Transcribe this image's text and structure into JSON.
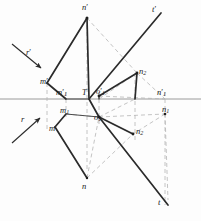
{
  "figure": {
    "ground_line": {
      "name": "horizontal-axis",
      "y": 99,
      "x1": 0,
      "x2": 201,
      "color": "#9a9a9a"
    },
    "colors": {
      "solid_line": "#2b2b2b",
      "dashed_line": "#b5b5b5",
      "axis": "#9a9a9a",
      "label_text": "#1a1a1a",
      "background": "#fdfdfd"
    }
  },
  "labels": {
    "n_prime": {
      "text": "n",
      "prime": "′",
      "sub": ""
    },
    "t_prime": {
      "text": "t",
      "prime": "′",
      "sub": ""
    },
    "r_prime": {
      "text": "r",
      "prime": "′",
      "sub": ""
    },
    "m_prime": {
      "text": "m",
      "prime": "′",
      "sub": ""
    },
    "m1_prime": {
      "text": "m",
      "prime": "′",
      "sub": "1"
    },
    "T": {
      "text": "T",
      "prime": "",
      "sub": ""
    },
    "o1_prime": {
      "text": "o",
      "prime": "′",
      "sub": "1"
    },
    "n2_upper": {
      "text": "n",
      "prime": "",
      "sub": "2"
    },
    "n1_prime": {
      "text": "n",
      "prime": "′",
      "sub": "1"
    },
    "r": {
      "text": "r",
      "prime": "",
      "sub": ""
    },
    "m1": {
      "text": "m",
      "prime": "",
      "sub": "1"
    },
    "m": {
      "text": "m",
      "prime": "",
      "sub": ""
    },
    "o1": {
      "text": "o",
      "prime": "",
      "sub": "1"
    },
    "n1": {
      "text": "n",
      "prime": "",
      "sub": "1"
    },
    "n2_lower": {
      "text": "n",
      "prime": "",
      "sub": "2"
    },
    "n": {
      "text": "n",
      "prime": "",
      "sub": ""
    },
    "t": {
      "text": "t",
      "prime": "",
      "sub": ""
    }
  },
  "label_positions": {
    "n_prime": {
      "x": 82,
      "y": 3
    },
    "t_prime": {
      "x": 152,
      "y": 5
    },
    "r_prime": {
      "x": 26,
      "y": 48
    },
    "m_prime": {
      "x": 40,
      "y": 77
    },
    "m1_prime": {
      "x": 56,
      "y": 88
    },
    "T": {
      "x": 82,
      "y": 88
    },
    "o1_prime": {
      "x": 96,
      "y": 87
    },
    "n2_upper": {
      "x": 139,
      "y": 67
    },
    "n1_prime": {
      "x": 157,
      "y": 88
    },
    "r": {
      "x": 21,
      "y": 115
    },
    "m1": {
      "x": 60,
      "y": 106
    },
    "m": {
      "x": 49,
      "y": 124
    },
    "o1": {
      "x": 94,
      "y": 113
    },
    "n1": {
      "x": 162,
      "y": 105
    },
    "n2_lower": {
      "x": 136,
      "y": 127
    },
    "n": {
      "x": 82,
      "y": 182
    },
    "t": {
      "x": 158,
      "y": 198
    }
  },
  "vertices": {
    "n_prime": {
      "x": 87,
      "y": 18
    },
    "m_prime": {
      "x": 47,
      "y": 83
    },
    "m1_prime": {
      "x": 66,
      "y": 99
    },
    "T": {
      "x": 89,
      "y": 99
    },
    "o1_prime": {
      "x": 99,
      "y": 96
    },
    "n2_upper": {
      "x": 137,
      "y": 73
    },
    "n1_prime": {
      "x": 165,
      "y": 99
    },
    "m1": {
      "x": 66,
      "y": 114
    },
    "m": {
      "x": 55,
      "y": 127
    },
    "o1": {
      "x": 99,
      "y": 117
    },
    "n1": {
      "x": 165,
      "y": 114
    },
    "n2_lower": {
      "x": 133,
      "y": 134
    },
    "n": {
      "x": 87,
      "y": 178
    },
    "t_prime_end": {
      "x": 161,
      "y": 13
    },
    "t_end": {
      "x": 168,
      "y": 205
    },
    "left_v_top": {
      "x": 47,
      "y": 83
    },
    "left_v_bot": {
      "x": 55,
      "y": 127
    }
  },
  "arrows": {
    "r_prime": {
      "from_x": 12,
      "from_y": 44,
      "to_x": 43,
      "to_y": 70,
      "direction": "down-right"
    },
    "r": {
      "from_x": 12,
      "from_y": 143,
      "to_x": 42,
      "to_y": 116,
      "direction": "up-right"
    }
  },
  "annotations": {
    "description": "Two-view (plan and elevation) orthographic projection with ground line, showing points m, n, o and their primed projections, plus trace lines r and t."
  }
}
